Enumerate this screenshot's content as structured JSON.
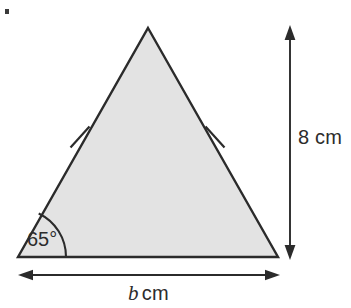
{
  "figure": {
    "type": "geometry-diagram",
    "shape": "isosceles-triangle",
    "background_color": "#ffffff",
    "fill_color": "#e3e3e3",
    "stroke_color": "#2b2b2b",
    "labels": {
      "angle": "65°",
      "height": "8 cm",
      "base_variable": "b",
      "base_unit": "cm"
    },
    "annotations": {
      "equal_side_marks": 2,
      "angle_arc_present": true,
      "height_arrow": "double-headed-vertical",
      "base_arrow": "double-headed-horizontal"
    },
    "measurements": {
      "base_angle_degrees": 65,
      "height_value": 8,
      "height_unit": "cm",
      "base_value": "b",
      "base_unit": "cm"
    },
    "geometry": {
      "apex": [
        148,
        28
      ],
      "bottom_left": [
        18,
        257
      ],
      "bottom_right": [
        278,
        257
      ],
      "height_arrow_x": 290,
      "height_arrow_top_y": 28,
      "height_arrow_bottom_y": 257,
      "base_arrow_y": 275,
      "base_arrow_left_x": 20,
      "base_arrow_right_x": 278,
      "angle_arc_radius": 48,
      "tick_left": [
        80,
        137
      ],
      "tick_right": [
        215,
        137
      ]
    }
  }
}
